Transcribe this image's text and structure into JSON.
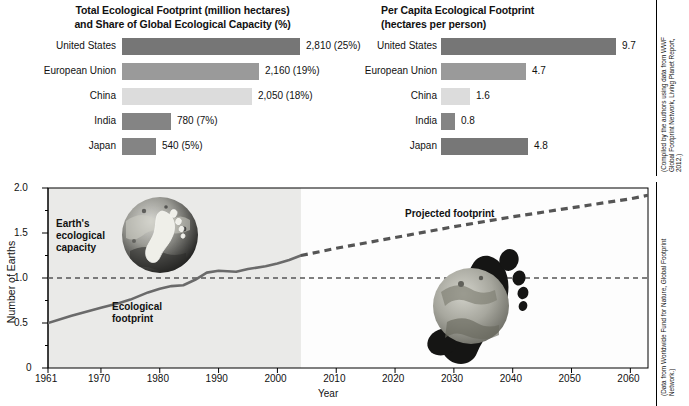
{
  "panels": {
    "total": {
      "title": "Total Ecological Footprint (million hectares) and Share of Global Ecological Capacity (%)",
      "title_line1": "Total Ecological Footprint (million hectares)",
      "title_line2": "and Share of Global Ecological Capacity (%)",
      "rows": [
        {
          "label": "United States",
          "value_text": "2,810 (25%)",
          "value": 2810,
          "share_pct": 25,
          "color": "#767676"
        },
        {
          "label": "European Union",
          "value_text": "2,160 (19%)",
          "value": 2160,
          "share_pct": 19,
          "color": "#9a9a9a"
        },
        {
          "label": "China",
          "value_text": "2,050 (18%)",
          "value": 2050,
          "share_pct": 18,
          "color": "#dcdcdc"
        },
        {
          "label": "India",
          "value_text": "780 (7%)",
          "value": 780,
          "share_pct": 7,
          "color": "#848484"
        },
        {
          "label": "Japan",
          "value_text": "540 (5%)",
          "value": 540,
          "share_pct": 5,
          "color": "#848484"
        }
      ]
    },
    "capita": {
      "title": "Per Capita Ecological Footprint (hectares per person)",
      "title_line1": "Per Capita Ecological Footprint",
      "title_line2": "(hectares per person)",
      "rows": [
        {
          "label": "United States",
          "value_text": "9.7",
          "value": 9.7,
          "color": "#767676"
        },
        {
          "label": "European Union",
          "value_text": "4.7",
          "value": 4.7,
          "color": "#9a9a9a"
        },
        {
          "label": "China",
          "value_text": "1.6",
          "value": 1.6,
          "color": "#dcdcdc"
        },
        {
          "label": "India",
          "value_text": "0.8",
          "value": 0.8,
          "color": "#848484"
        },
        {
          "label": "Japan",
          "value_text": "4.8",
          "value": 4.8,
          "color": "#777777"
        }
      ]
    }
  },
  "linechart": {
    "ylabel": "Number of Earths",
    "xlabel": "Year",
    "yticks": [
      "0",
      "0.5",
      "1.0",
      "1.5",
      "2.0"
    ],
    "xticks": [
      "1961",
      "1970",
      "1980",
      "1990",
      "2000",
      "2010",
      "2020",
      "2030",
      "2040",
      "2050",
      "2060"
    ],
    "annotations": {
      "capacity_l1": "Earth's",
      "capacity_l2": "ecological",
      "capacity_l3": "capacity",
      "footprint_l1": "Ecological",
      "footprint_l2": "footprint",
      "projected": "Projected footprint"
    }
  },
  "credits": {
    "top": "(Compiled by the authors using data from WWF Global Footprint Network, Living Planet Report, 2012.)",
    "bottom": "(Data from Worldwide Fund for Nature, Global Footprint Network.)"
  },
  "chart_data": [
    {
      "type": "bar",
      "orientation": "horizontal",
      "title": "Total Ecological Footprint (million hectares) and Share of Global Ecological Capacity (%)",
      "xlabel": "Million hectares",
      "ylabel": "",
      "categories": [
        "United States",
        "European Union",
        "China",
        "India",
        "Japan"
      ],
      "values": [
        2810,
        2160,
        2050,
        780,
        540
      ],
      "data_labels": [
        "2,810 (25%)",
        "2,160 (19%)",
        "2,050 (18%)",
        "780 (7%)",
        "540 (5%)"
      ],
      "share_of_global_capacity_pct": [
        25,
        19,
        18,
        7,
        5
      ],
      "xlim": [
        0,
        2810
      ],
      "grid": false,
      "legend": "none"
    },
    {
      "type": "bar",
      "orientation": "horizontal",
      "title": "Per Capita Ecological Footprint (hectares per person)",
      "xlabel": "Hectares per person",
      "ylabel": "",
      "categories": [
        "United States",
        "European Union",
        "China",
        "India",
        "Japan"
      ],
      "values": [
        9.7,
        4.7,
        1.6,
        0.8,
        4.8
      ],
      "data_labels": [
        "9.7",
        "4.7",
        "1.6",
        "0.8",
        "4.8"
      ],
      "xlim": [
        0,
        9.7
      ],
      "grid": false,
      "legend": "none"
    },
    {
      "type": "line",
      "title": "",
      "xlabel": "Year",
      "ylabel": "Number of Earths",
      "xlim": [
        1961,
        2063
      ],
      "ylim": [
        0,
        2.0
      ],
      "yticks": [
        0,
        0.5,
        1.0,
        1.5,
        2.0
      ],
      "xticks": [
        1961,
        1970,
        1980,
        1990,
        2000,
        2010,
        2020,
        2030,
        2040,
        2050,
        2060
      ],
      "grid": false,
      "legend": "none",
      "shaded_region": {
        "label": "historical",
        "x_from": 1961,
        "x_to": 2004
      },
      "series": [
        {
          "name": "Ecological footprint",
          "style": "solid",
          "x": [
            1961,
            1965,
            1970,
            1973,
            1975,
            1978,
            1980,
            1982,
            1984,
            1986,
            1988,
            1990,
            1993,
            1995,
            1998,
            2000,
            2002,
            2004
          ],
          "values": [
            0.5,
            0.58,
            0.67,
            0.72,
            0.76,
            0.84,
            0.88,
            0.91,
            0.92,
            0.98,
            1.06,
            1.08,
            1.07,
            1.1,
            1.13,
            1.16,
            1.2,
            1.25
          ]
        },
        {
          "name": "Projected footprint",
          "style": "dashed",
          "x": [
            2004,
            2010,
            2020,
            2030,
            2040,
            2050,
            2060,
            2063
          ],
          "values": [
            1.25,
            1.33,
            1.45,
            1.57,
            1.68,
            1.78,
            1.88,
            1.92
          ]
        },
        {
          "name": "Earth's ecological capacity",
          "style": "dashed-reference",
          "x": [
            1961,
            2063
          ],
          "values": [
            1.0,
            1.0
          ]
        }
      ]
    }
  ]
}
